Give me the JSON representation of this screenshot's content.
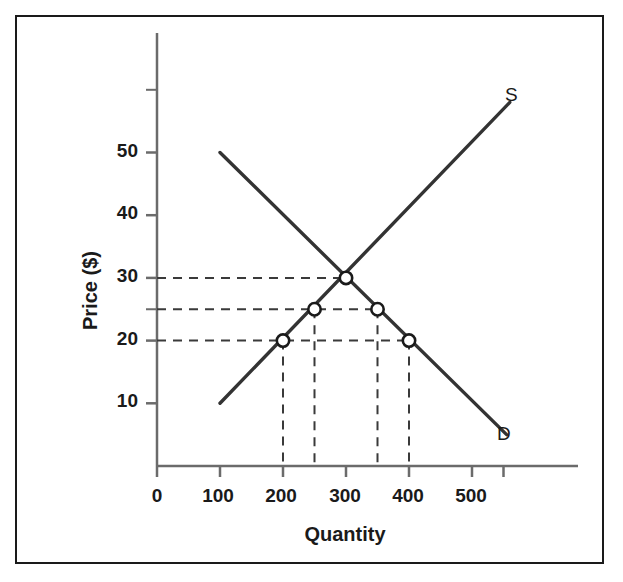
{
  "chart_data": {
    "type": "line",
    "title": "",
    "xlabel": "Quantity",
    "ylabel": "Price ($)",
    "xlim": [
      0,
      570
    ],
    "ylim": [
      0,
      62
    ],
    "grid": false,
    "legend_position": "inline-curve-end",
    "x_ticks": [
      0,
      100,
      200,
      300,
      400,
      500
    ],
    "x_tick_labels": [
      "0",
      "100",
      "200",
      "300",
      "400",
      "500"
    ],
    "y_ticks": [
      10,
      20,
      25,
      30,
      40,
      50,
      60
    ],
    "y_tick_labels": [
      "10",
      "20",
      "",
      "30",
      "40",
      "50",
      ""
    ],
    "y_labeled_ticks": [
      10,
      20,
      30,
      40,
      50
    ],
    "series": [
      {
        "name": "S",
        "label": "S",
        "description": "supply curve, upward sloping",
        "points": [
          [
            100,
            10
          ],
          [
            560,
            58
          ]
        ],
        "color": "#333333"
      },
      {
        "name": "D",
        "label": "D",
        "description": "demand curve, downward sloping",
        "points": [
          [
            100,
            50
          ],
          [
            555,
            5
          ]
        ],
        "color": "#333333"
      }
    ],
    "markers": [
      {
        "x": 200,
        "y": 20,
        "on": "S"
      },
      {
        "x": 250,
        "y": 25,
        "on": "S"
      },
      {
        "x": 300,
        "y": 30,
        "on": "equilibrium"
      },
      {
        "x": 350,
        "y": 25,
        "on": "D"
      },
      {
        "x": 400,
        "y": 20,
        "on": "D"
      }
    ],
    "guide_lines_horizontal": [
      30,
      25,
      20
    ],
    "guide_lines_vertical": [
      200,
      250,
      350,
      400
    ],
    "equilibrium": {
      "quantity": 300,
      "price": 30
    },
    "colors": {
      "curve": "#333333",
      "axis": "#666666",
      "guide": "#444444",
      "frame": "#1a1a1a",
      "text": "#1a1a1a",
      "marker_fill": "#ffffff"
    }
  },
  "axes": {
    "y_title": "Price ($)",
    "x_title": "Quantity",
    "y_labels": [
      {
        "value": "50",
        "px": 150
      },
      {
        "value": "40",
        "px": 212
      },
      {
        "value": "30",
        "px": 275
      },
      {
        "value": "20",
        "px": 338
      },
      {
        "value": "10",
        "px": 400
      }
    ],
    "x_labels": [
      {
        "value": "0",
        "px": 157
      },
      {
        "value": "100",
        "px": 218
      },
      {
        "value": "200",
        "px": 281
      },
      {
        "value": "300",
        "px": 345
      },
      {
        "value": "400",
        "px": 408
      },
      {
        "value": "500",
        "px": 471
      }
    ]
  },
  "curve_labels": {
    "supply": "S",
    "demand": "D"
  }
}
